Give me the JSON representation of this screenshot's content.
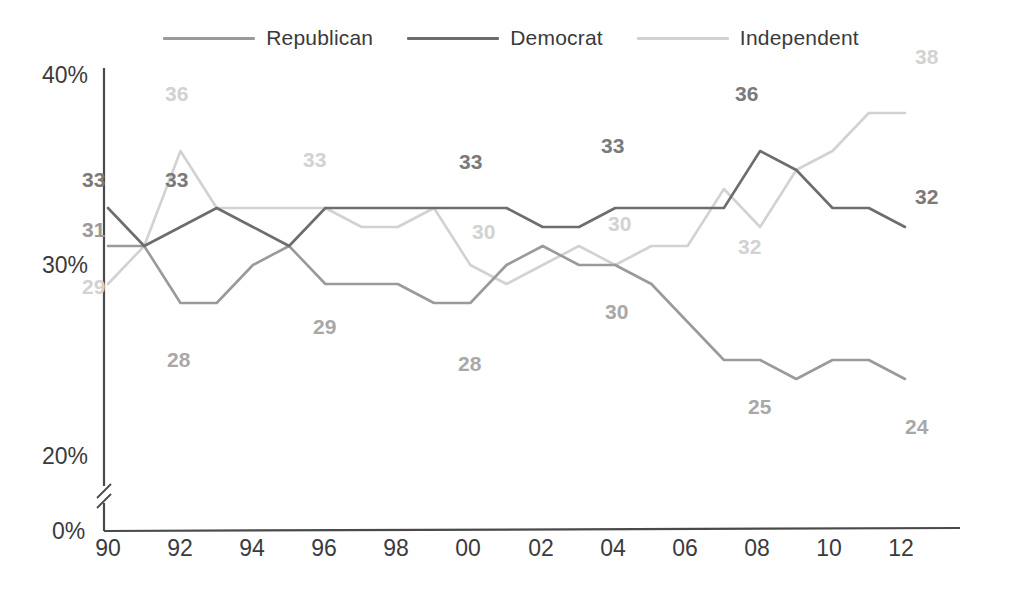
{
  "legend": {
    "position": "top-center",
    "items": [
      {
        "name": "Republican",
        "color": "#9a9a9a"
      },
      {
        "name": "Democrat",
        "color": "#6d6d6d"
      },
      {
        "name": "Independent",
        "color": "#d2d2d2"
      }
    ]
  },
  "axes": {
    "y_ticks": [
      "40%",
      "30%",
      "20%",
      "0%"
    ],
    "x_ticks": [
      "90",
      "92",
      "94",
      "96",
      "98",
      "00",
      "02",
      "04",
      "06",
      "08",
      "10",
      "12"
    ],
    "axis_break": true,
    "axis_color": "#4a4a4a"
  },
  "chart_data": {
    "type": "line",
    "title": "",
    "subtitle": "",
    "xlabel": "",
    "ylabel": "",
    "ylim": [
      20,
      40
    ],
    "y_ticks": [
      20,
      30,
      40
    ],
    "y_tick_labels": [
      "20%",
      "30%",
      "40%",
      "0%"
    ],
    "grid": false,
    "legend_position": "top-center",
    "axis_break_below": 20,
    "x": [
      1990,
      1991,
      1992,
      1993,
      1994,
      1995,
      1996,
      1997,
      1998,
      1999,
      2000,
      2001,
      2002,
      2003,
      2004,
      2005,
      2006,
      2007,
      2008,
      2009,
      2010,
      2011,
      2012
    ],
    "x_tick_labels": [
      "90",
      "92",
      "94",
      "96",
      "98",
      "00",
      "02",
      "04",
      "06",
      "08",
      "10",
      "12"
    ],
    "series": [
      {
        "name": "Republican",
        "color": "#9a9a9a",
        "values": [
          31,
          31,
          28,
          28,
          30,
          31,
          29,
          29,
          29,
          28,
          28,
          30,
          31,
          30,
          30,
          29,
          27,
          25,
          25,
          24,
          25,
          25,
          24
        ]
      },
      {
        "name": "Democrat",
        "color": "#6d6d6d",
        "values": [
          33,
          31,
          32,
          33,
          32,
          31,
          33,
          33,
          33,
          33,
          33,
          33,
          32,
          32,
          33,
          33,
          33,
          33,
          36,
          35,
          33,
          33,
          32
        ]
      },
      {
        "name": "Independent",
        "color": "#d2d2d2",
        "values": [
          29,
          31,
          36,
          33,
          33,
          33,
          33,
          32,
          32,
          33,
          30,
          29,
          30,
          31,
          30,
          31,
          31,
          34,
          32,
          35,
          36,
          38,
          38
        ]
      }
    ],
    "point_labels": [
      {
        "series": "Democrat",
        "year": 1990,
        "value": 33,
        "text": "33"
      },
      {
        "series": "Republican",
        "year": 1990,
        "value": 31,
        "text": "31"
      },
      {
        "series": "Independent",
        "year": 1990,
        "value": 29,
        "text": "29"
      },
      {
        "series": "Independent",
        "year": 1992,
        "value": 36,
        "text": "36"
      },
      {
        "series": "Democrat",
        "year": 1993,
        "value": 33,
        "text": "33"
      },
      {
        "series": "Republican",
        "year": 1992,
        "value": 28,
        "text": "28"
      },
      {
        "series": "Independent",
        "year": 1996,
        "value": 33,
        "text": "33"
      },
      {
        "series": "Republican",
        "year": 1996,
        "value": 29,
        "text": "29"
      },
      {
        "series": "Democrat",
        "year": 2000,
        "value": 33,
        "text": "33"
      },
      {
        "series": "Independent",
        "year": 2000,
        "value": 30,
        "text": "30"
      },
      {
        "series": "Republican",
        "year": 1999,
        "value": 28,
        "text": "28"
      },
      {
        "series": "Democrat",
        "year": 2004,
        "value": 33,
        "text": "33"
      },
      {
        "series": "Independent",
        "year": 2004,
        "value": 30,
        "text": "30"
      },
      {
        "series": "Republican",
        "year": 2003,
        "value": 30,
        "text": "30"
      },
      {
        "series": "Democrat",
        "year": 2008,
        "value": 36,
        "text": "36"
      },
      {
        "series": "Independent",
        "year": 2008,
        "value": 32,
        "text": "32"
      },
      {
        "series": "Republican",
        "year": 2007,
        "value": 25,
        "text": "25"
      },
      {
        "series": "Independent",
        "year": 2012,
        "value": 38,
        "text": "38"
      },
      {
        "series": "Democrat",
        "year": 2012,
        "value": 32,
        "text": "32"
      },
      {
        "series": "Republican",
        "year": 2012,
        "value": 24,
        "text": "24"
      }
    ]
  },
  "label_positions": [
    {
      "id": "dem-1990",
      "text": "33",
      "x": 82,
      "y": 168,
      "color": "#7a7a7a"
    },
    {
      "id": "rep-1990",
      "text": "31",
      "x": 82,
      "y": 218,
      "color": "#9a9a9a"
    },
    {
      "id": "ind-1990",
      "text": "29",
      "x": 82,
      "y": 275,
      "color": "#d2d2d2"
    },
    {
      "id": "ind-1992",
      "text": "36",
      "x": 165,
      "y": 82,
      "color": "#d2d2d2"
    },
    {
      "id": "dem-1993",
      "text": "33",
      "x": 165,
      "y": 168,
      "color": "#7a7a7a"
    },
    {
      "id": "rep-1992",
      "text": "28",
      "x": 167,
      "y": 348,
      "color": "#a8a8a8"
    },
    {
      "id": "ind-1996",
      "text": "33",
      "x": 303,
      "y": 148,
      "color": "#d2d2d2"
    },
    {
      "id": "rep-1996",
      "text": "29",
      "x": 313,
      "y": 315,
      "color": "#a8a8a8"
    },
    {
      "id": "dem-2000",
      "text": "33",
      "x": 459,
      "y": 150,
      "color": "#7a7a7a"
    },
    {
      "id": "ind-2000",
      "text": "30",
      "x": 472,
      "y": 220,
      "color": "#d2d2d2"
    },
    {
      "id": "rep-1999",
      "text": "28",
      "x": 458,
      "y": 352,
      "color": "#a8a8a8"
    },
    {
      "id": "dem-2004",
      "text": "33",
      "x": 601,
      "y": 134,
      "color": "#7a7a7a"
    },
    {
      "id": "ind-2004",
      "text": "30",
      "x": 608,
      "y": 212,
      "color": "#d2d2d2"
    },
    {
      "id": "rep-2003",
      "text": "30",
      "x": 605,
      "y": 300,
      "color": "#a8a8a8"
    },
    {
      "id": "dem-2008",
      "text": "36",
      "x": 735,
      "y": 82,
      "color": "#7a7a7a"
    },
    {
      "id": "ind-2008",
      "text": "32",
      "x": 738,
      "y": 235,
      "color": "#d2d2d2"
    },
    {
      "id": "rep-2007",
      "text": "25",
      "x": 748,
      "y": 395,
      "color": "#a8a8a8"
    },
    {
      "id": "ind-2012",
      "text": "38",
      "x": 915,
      "y": 45,
      "color": "#d2d2d2"
    },
    {
      "id": "dem-2012",
      "text": "32",
      "x": 915,
      "y": 185,
      "color": "#7a7a7a"
    },
    {
      "id": "rep-2012",
      "text": "24",
      "x": 905,
      "y": 415,
      "color": "#a8a8a8"
    }
  ],
  "tick_positions": {
    "y": [
      {
        "label": "40%",
        "x": 42,
        "y": 62
      },
      {
        "label": "30%",
        "x": 42,
        "y": 252
      },
      {
        "label": "20%",
        "x": 42,
        "y": 443
      },
      {
        "label": "0%",
        "x": 52,
        "y": 518
      }
    ],
    "x": [
      {
        "label": "90",
        "x": 93,
        "y": 535
      },
      {
        "label": "92",
        "x": 165,
        "y": 535
      },
      {
        "label": "94",
        "x": 237,
        "y": 535
      },
      {
        "label": "96",
        "x": 309,
        "y": 535
      },
      {
        "label": "98",
        "x": 381,
        "y": 535
      },
      {
        "label": "00",
        "x": 453,
        "y": 535
      },
      {
        "label": "02",
        "x": 526,
        "y": 535
      },
      {
        "label": "04",
        "x": 598,
        "y": 535
      },
      {
        "label": "06",
        "x": 670,
        "y": 535
      },
      {
        "label": "08",
        "x": 742,
        "y": 535
      },
      {
        "label": "10",
        "x": 814,
        "y": 535
      },
      {
        "label": "12",
        "x": 886,
        "y": 535
      }
    ]
  }
}
